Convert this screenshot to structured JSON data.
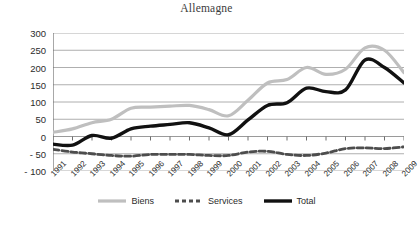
{
  "chart_data": {
    "type": "line",
    "title": "Allemagne",
    "xlabel": "",
    "ylabel": "",
    "ylim": [
      -100,
      300
    ],
    "ytick_values": [
      300,
      250,
      200,
      150,
      100,
      50,
      0,
      -50,
      -100
    ],
    "ytick_labels": [
      "300",
      "250",
      "200",
      "150",
      "100",
      "50",
      "0",
      "- 50",
      "- 100"
    ],
    "grid": true,
    "legend_position": "bottom",
    "categories": [
      "1991",
      "1992",
      "1993",
      "1994",
      "1995",
      "1996",
      "1997",
      "1998",
      "1999",
      "2000",
      "2001",
      "2002",
      "2003",
      "2004",
      "2005",
      "2006",
      "2007",
      "2008",
      "2009"
    ],
    "series": [
      {
        "name": "Biens",
        "color": "#bfbfbf",
        "style": "solid",
        "width": 3.2,
        "values": [
          12,
          22,
          40,
          50,
          82,
          85,
          88,
          90,
          78,
          60,
          105,
          155,
          165,
          200,
          180,
          195,
          257,
          250,
          185
        ]
      },
      {
        "name": "Services",
        "color": "#4d4d4d",
        "style": "dashed",
        "width": 2.8,
        "values": [
          -37,
          -45,
          -50,
          -55,
          -57,
          -52,
          -52,
          -52,
          -55,
          -55,
          -45,
          -43,
          -52,
          -55,
          -48,
          -35,
          -33,
          -35,
          -30
        ]
      },
      {
        "name": "Total",
        "color": "#111111",
        "style": "solid",
        "width": 3.4,
        "values": [
          -22,
          -25,
          3,
          -5,
          22,
          30,
          35,
          40,
          25,
          5,
          48,
          90,
          98,
          140,
          130,
          135,
          222,
          200,
          155
        ]
      }
    ]
  },
  "axis": {
    "axis_color": "#6e6e6e",
    "grid_color": "#9a9a9a"
  },
  "legend": {
    "items": [
      {
        "label": "Biens",
        "icon": "line-swatch-solid-gray"
      },
      {
        "label": "Services",
        "icon": "line-swatch-dashed-dark"
      },
      {
        "label": "Total",
        "icon": "line-swatch-solid-black"
      }
    ]
  }
}
